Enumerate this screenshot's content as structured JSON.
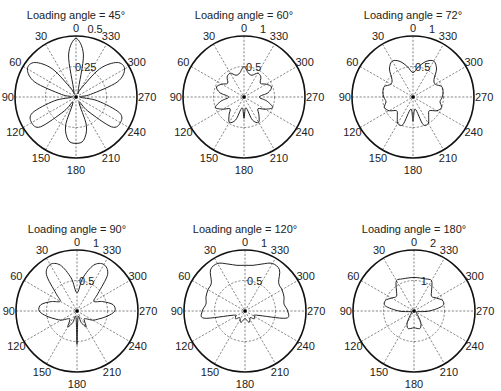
{
  "chart_data": [
    {
      "type": "polar-line",
      "title": "Loading angle = 45°",
      "center": [
        76,
        97
      ],
      "radius": 61,
      "rmax": 0.5,
      "rings": [
        0.25
      ],
      "ring_labels": [
        "0.25"
      ],
      "outer_label": "0.5",
      "angle_ticks": [
        0,
        30,
        60,
        90,
        120,
        150,
        180,
        210,
        240,
        270,
        300,
        330
      ],
      "angle_direction": "counterclockwise-from-top",
      "series": [
        {
          "name": "pattern",
          "theta_deg": [
            0,
            10,
            20,
            30,
            40,
            50,
            60,
            70,
            80,
            90,
            100,
            110,
            120,
            130,
            140,
            150,
            160,
            170,
            180,
            190,
            200,
            210,
            220,
            230,
            240,
            250,
            260,
            270,
            280,
            290,
            300,
            310,
            320,
            330,
            340,
            350,
            360
          ],
          "r": [
            0.48,
            0.35,
            0.05,
            0.08,
            0.3,
            0.44,
            0.46,
            0.36,
            0.12,
            0.03,
            0.18,
            0.38,
            0.42,
            0.38,
            0.15,
            0.05,
            0.25,
            0.36,
            0.38,
            0.36,
            0.25,
            0.05,
            0.15,
            0.38,
            0.42,
            0.38,
            0.18,
            0.03,
            0.12,
            0.36,
            0.46,
            0.44,
            0.3,
            0.08,
            0.05,
            0.35,
            0.48
          ]
        }
      ]
    },
    {
      "type": "polar-line",
      "title": "Loading angle = 60°",
      "center": [
        244,
        97
      ],
      "radius": 61,
      "rmax": 1,
      "rings": [
        0.5
      ],
      "ring_labels": [
        "0.5"
      ],
      "outer_label": "1",
      "angle_ticks": [
        0,
        30,
        60,
        90,
        120,
        150,
        180,
        210,
        240,
        270,
        300,
        330
      ],
      "angle_direction": "counterclockwise-from-top",
      "series": [
        {
          "name": "pattern",
          "theta_deg": [
            0,
            10,
            20,
            30,
            40,
            50,
            60,
            70,
            80,
            90,
            100,
            110,
            120,
            130,
            140,
            150,
            160,
            170,
            180,
            190,
            200,
            210,
            220,
            230,
            240,
            250,
            260,
            270,
            280,
            290,
            300,
            310,
            320,
            330,
            340,
            350,
            360
          ],
          "r": [
            0.5,
            0.4,
            0.38,
            0.45,
            0.43,
            0.35,
            0.42,
            0.48,
            0.4,
            0.25,
            0.38,
            0.5,
            0.4,
            0.3,
            0.38,
            0.48,
            0.4,
            0.18,
            0.35,
            0.18,
            0.4,
            0.48,
            0.38,
            0.3,
            0.4,
            0.5,
            0.38,
            0.25,
            0.4,
            0.48,
            0.42,
            0.35,
            0.43,
            0.45,
            0.38,
            0.4,
            0.5
          ]
        }
      ]
    },
    {
      "type": "polar-line",
      "title": "Loading angle = 72°",
      "center": [
        413,
        97
      ],
      "radius": 61,
      "rmax": 1,
      "rings": [
        0.5
      ],
      "ring_labels": [
        "0.5"
      ],
      "outer_label": "1",
      "angle_ticks": [
        0,
        30,
        60,
        90,
        120,
        150,
        180,
        210,
        240,
        270,
        300,
        330
      ],
      "angle_direction": "counterclockwise-from-top",
      "series": [
        {
          "name": "pattern",
          "theta_deg": [
            0,
            10,
            20,
            30,
            40,
            50,
            60,
            70,
            80,
            90,
            100,
            110,
            120,
            130,
            140,
            150,
            160,
            170,
            180,
            190,
            200,
            210,
            220,
            230,
            240,
            250,
            260,
            270,
            280,
            290,
            300,
            310,
            320,
            330,
            340,
            350,
            360
          ],
          "r": [
            0.4,
            0.5,
            0.62,
            0.68,
            0.6,
            0.45,
            0.42,
            0.5,
            0.5,
            0.48,
            0.45,
            0.5,
            0.45,
            0.35,
            0.4,
            0.5,
            0.48,
            0.2,
            0.4,
            0.2,
            0.48,
            0.5,
            0.4,
            0.35,
            0.45,
            0.5,
            0.45,
            0.48,
            0.5,
            0.5,
            0.42,
            0.45,
            0.6,
            0.68,
            0.62,
            0.5,
            0.4
          ]
        }
      ]
    },
    {
      "type": "polar-line",
      "title": "Loading angle = 90°",
      "center": [
        77,
        311
      ],
      "radius": 61,
      "rmax": 1,
      "rings": [
        0.5
      ],
      "ring_labels": [
        "0.5"
      ],
      "outer_label": "1",
      "angle_ticks": [
        0,
        30,
        60,
        90,
        120,
        150,
        180,
        210,
        240,
        270,
        300,
        330
      ],
      "angle_direction": "counterclockwise-from-top",
      "series": [
        {
          "name": "pattern",
          "theta_deg": [
            0,
            10,
            20,
            30,
            40,
            50,
            60,
            70,
            80,
            90,
            100,
            110,
            120,
            130,
            140,
            150,
            160,
            170,
            180,
            190,
            200,
            210,
            220,
            230,
            240,
            250,
            260,
            270,
            280,
            290,
            300,
            310,
            320,
            330,
            340,
            350,
            360
          ],
          "r": [
            0.3,
            0.55,
            0.8,
            0.88,
            0.78,
            0.45,
            0.32,
            0.45,
            0.6,
            0.62,
            0.5,
            0.38,
            0.3,
            0.2,
            0.18,
            0.3,
            0.2,
            0.1,
            0.55,
            0.1,
            0.2,
            0.3,
            0.18,
            0.2,
            0.3,
            0.38,
            0.5,
            0.62,
            0.6,
            0.45,
            0.32,
            0.45,
            0.78,
            0.88,
            0.8,
            0.55,
            0.3
          ]
        }
      ]
    },
    {
      "type": "polar-line",
      "title": "Loading angle = 120°",
      "center": [
        245,
        311
      ],
      "radius": 61,
      "rmax": 1,
      "rings": [
        0.5
      ],
      "ring_labels": [
        "0.5"
      ],
      "outer_label": "1",
      "angle_ticks": [
        0,
        30,
        60,
        90,
        120,
        150,
        180,
        210,
        240,
        270,
        300,
        330
      ],
      "angle_direction": "counterclockwise-from-top",
      "series": [
        {
          "name": "pattern",
          "theta_deg": [
            0,
            10,
            20,
            30,
            40,
            50,
            60,
            70,
            80,
            90,
            100,
            110,
            120,
            130,
            140,
            150,
            160,
            170,
            180,
            190,
            200,
            210,
            220,
            230,
            240,
            250,
            260,
            270,
            280,
            290,
            300,
            310,
            320,
            330,
            340,
            350,
            360
          ],
          "r": [
            0.75,
            0.76,
            0.82,
            0.9,
            0.88,
            0.72,
            0.7,
            0.68,
            0.65,
            0.7,
            0.68,
            0.2,
            0.18,
            0.2,
            0.14,
            0.16,
            0.2,
            0.15,
            0.12,
            0.15,
            0.2,
            0.16,
            0.14,
            0.2,
            0.18,
            0.2,
            0.68,
            0.7,
            0.65,
            0.68,
            0.7,
            0.72,
            0.88,
            0.9,
            0.82,
            0.76,
            0.75
          ]
        }
      ]
    },
    {
      "type": "polar-line",
      "title": "Loading angle = 180°",
      "center": [
        414,
        311
      ],
      "radius": 61,
      "rmax": 2,
      "rings": [
        1
      ],
      "ring_labels": [
        "1"
      ],
      "outer_label": "2",
      "angle_ticks": [
        0,
        30,
        60,
        90,
        120,
        150,
        180,
        210,
        240,
        270,
        300,
        330
      ],
      "angle_direction": "counterclockwise-from-top",
      "series": [
        {
          "name": "pattern",
          "theta_deg": [
            0,
            10,
            20,
            30,
            40,
            50,
            60,
            70,
            80,
            90,
            100,
            110,
            120,
            130,
            140,
            150,
            160,
            170,
            180,
            190,
            200,
            210,
            220,
            230,
            240,
            250,
            260,
            270,
            280,
            290,
            300,
            310,
            320,
            330,
            340,
            350,
            360
          ],
          "r": [
            1.1,
            1.1,
            1.12,
            1.15,
            0.9,
            0.75,
            0.85,
            1.0,
            0.95,
            0.5,
            0.12,
            0.08,
            0.1,
            0.1,
            0.2,
            0.45,
            0.6,
            0.58,
            0.55,
            0.58,
            0.6,
            0.45,
            0.2,
            0.1,
            0.1,
            0.08,
            0.12,
            0.5,
            0.95,
            1.0,
            0.85,
            0.75,
            0.9,
            1.15,
            1.12,
            1.1,
            1.1
          ]
        }
      ]
    }
  ]
}
